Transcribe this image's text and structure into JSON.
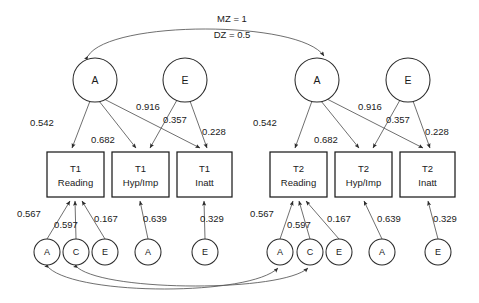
{
  "diagram": {
    "correlation_labels": {
      "mz": "MZ = 1",
      "dz": "DZ = 0.5"
    },
    "latent_top": [
      {
        "id": "t1-A",
        "label": "A",
        "cx": 95,
        "cy": 80,
        "r": 22
      },
      {
        "id": "t1-E",
        "label": "E",
        "cx": 185,
        "cy": 80,
        "r": 22
      },
      {
        "id": "t2-A",
        "label": "A",
        "cx": 317,
        "cy": 80,
        "r": 22
      },
      {
        "id": "t2-E",
        "label": "E",
        "cx": 408,
        "cy": 80,
        "r": 22
      }
    ],
    "indicators": [
      {
        "id": "t1-reading",
        "line1": "T1",
        "line2": "Reading",
        "x": 47,
        "y": 152,
        "w": 57,
        "h": 45
      },
      {
        "id": "t1-hypimp",
        "line1": "T1",
        "line2": "Hyp/Imp",
        "x": 112,
        "y": 152,
        "w": 57,
        "h": 45
      },
      {
        "id": "t1-inatt",
        "line1": "T1",
        "line2": "Inatt",
        "x": 177,
        "y": 152,
        "w": 55,
        "h": 45
      },
      {
        "id": "t2-reading",
        "line1": "T2",
        "line2": "Reading",
        "x": 270,
        "y": 152,
        "w": 57,
        "h": 45
      },
      {
        "id": "t2-hypimp",
        "line1": "T2",
        "line2": "Hyp/Imp",
        "x": 335,
        "y": 152,
        "w": 57,
        "h": 45
      },
      {
        "id": "t2-inatt",
        "line1": "T2",
        "line2": "Inatt",
        "x": 400,
        "y": 152,
        "w": 55,
        "h": 45
      }
    ],
    "latent_bottom": [
      {
        "id": "t1-res-A-read",
        "label": "A",
        "cx": 47,
        "cy": 252,
        "r": 13
      },
      {
        "id": "t1-res-C-read",
        "label": "C",
        "cx": 76,
        "cy": 252,
        "r": 13
      },
      {
        "id": "t1-res-E-read",
        "label": "E",
        "cx": 105,
        "cy": 252,
        "r": 13
      },
      {
        "id": "t1-res-A-hyp",
        "label": "A",
        "cx": 148,
        "cy": 252,
        "r": 13
      },
      {
        "id": "t1-res-E-inatt",
        "label": "E",
        "cx": 205,
        "cy": 252,
        "r": 13
      },
      {
        "id": "t2-res-A-read",
        "label": "A",
        "cx": 280,
        "cy": 252,
        "r": 13
      },
      {
        "id": "t2-res-C-read",
        "label": "C",
        "cx": 310,
        "cy": 252,
        "r": 13
      },
      {
        "id": "t2-res-E-read",
        "label": "E",
        "cx": 339,
        "cy": 252,
        "r": 13
      },
      {
        "id": "t2-res-A-hyp",
        "label": "A",
        "cx": 382,
        "cy": 252,
        "r": 13
      },
      {
        "id": "t2-res-E-inatt",
        "label": "E",
        "cx": 438,
        "cy": 252,
        "r": 13
      }
    ],
    "coefficients_top": [
      {
        "id": "t1-a-reading",
        "value": "0.542",
        "x": 42,
        "y": 126
      },
      {
        "id": "t1-a-hypimp",
        "value": "0.916",
        "x": 148,
        "y": 110
      },
      {
        "id": "t1-a-inatt",
        "value": "0.682",
        "x": 103,
        "y": 143
      },
      {
        "id": "t1-e-hypimp",
        "value": "0.357",
        "x": 175,
        "y": 123
      },
      {
        "id": "t1-e-inatt",
        "value": "0.228",
        "x": 214,
        "y": 135
      },
      {
        "id": "t2-a-reading",
        "value": "0.542",
        "x": 265,
        "y": 126
      },
      {
        "id": "t2-a-hypimp",
        "value": "0.916",
        "x": 370,
        "y": 110
      },
      {
        "id": "t2-a-inatt",
        "value": "0.682",
        "x": 326,
        "y": 143
      },
      {
        "id": "t2-e-hypimp",
        "value": "0.357",
        "x": 398,
        "y": 123
      },
      {
        "id": "t2-e-inatt",
        "value": "0.228",
        "x": 437,
        "y": 135
      }
    ],
    "coefficients_bottom": [
      {
        "id": "t1-res-a-read-coef",
        "value": "0.567",
        "x": 29,
        "y": 217
      },
      {
        "id": "t1-res-c-read-coef",
        "value": "0.597",
        "x": 66,
        "y": 228
      },
      {
        "id": "t1-res-e-read-coef",
        "value": "0.167",
        "x": 106,
        "y": 222
      },
      {
        "id": "t1-res-a-hyp-coef",
        "value": "0.639",
        "x": 155,
        "y": 222
      },
      {
        "id": "t1-res-e-inatt-coef",
        "value": "0.329",
        "x": 212,
        "y": 222
      },
      {
        "id": "t2-res-a-read-coef",
        "value": "0.567",
        "x": 262,
        "y": 217
      },
      {
        "id": "t2-res-c-read-coef",
        "value": "0.597",
        "x": 299,
        "y": 228
      },
      {
        "id": "t2-res-e-read-coef",
        "value": "0.167",
        "x": 339,
        "y": 222
      },
      {
        "id": "t2-res-a-hyp-coef",
        "value": "0.639",
        "x": 389,
        "y": 222
      },
      {
        "id": "t2-res-e-inatt-coef",
        "value": "0.329",
        "x": 445,
        "y": 222
      }
    ]
  }
}
